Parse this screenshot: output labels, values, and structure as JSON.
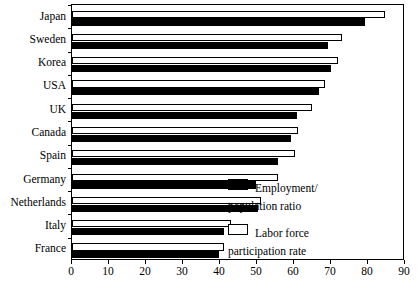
{
  "chart_data": {
    "type": "bar",
    "orientation": "horizontal",
    "title": "",
    "subtitle": "",
    "xlabel": "",
    "ylabel": "",
    "xlim": [
      0,
      90
    ],
    "xticks": [
      0,
      10,
      20,
      30,
      40,
      50,
      60,
      70,
      80,
      90
    ],
    "xtick_labels": [
      "0",
      "10",
      "20",
      "30",
      "40",
      "50",
      "60",
      "70",
      "80",
      "90"
    ],
    "grid": false,
    "legend_position": "inside-right",
    "categories": [
      "Japan",
      "Sweden",
      "Korea",
      "USA",
      "UK",
      "Canada",
      "Spain",
      "Germany",
      "Netherlands",
      "Italy",
      "France"
    ],
    "series": [
      {
        "name": "Employment/\npopulation ratio",
        "color": "#000000",
        "values": [
          79.3,
          69.2,
          69.9,
          66.7,
          60.9,
          59.1,
          55.6,
          49.8,
          50.3,
          41.0,
          39.6
        ]
      },
      {
        "name": "Labor force\nparticipation rate",
        "color": "#ffffff",
        "values": [
          84.7,
          73.0,
          71.9,
          68.3,
          64.9,
          61.0,
          60.4,
          55.6,
          51.2,
          43.0,
          41.0
        ]
      }
    ]
  },
  "legend": {
    "items": [
      {
        "label": "Employment/\npopulation ratio",
        "swatch": "filled"
      },
      {
        "label": "Labor force\nparticipation rate",
        "swatch": "hollow"
      }
    ]
  }
}
